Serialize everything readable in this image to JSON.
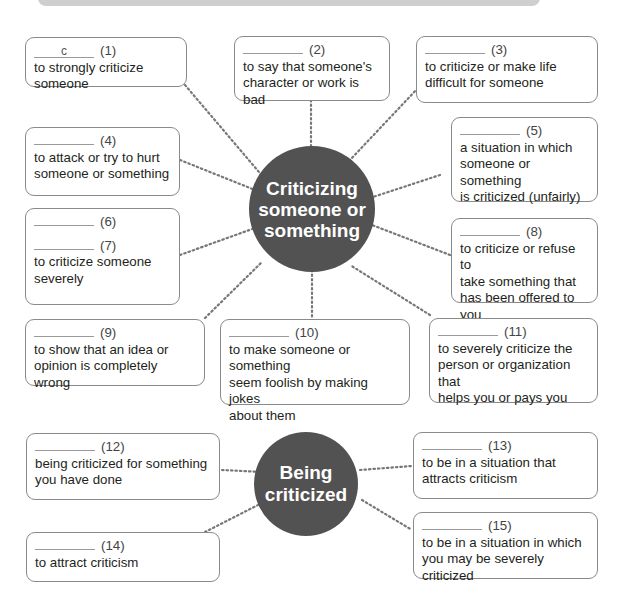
{
  "diagram": {
    "hub1": {
      "label_lines": [
        "Criticizing",
        "someone or",
        "something"
      ]
    },
    "hub2": {
      "label_lines": [
        "Being",
        "criticized"
      ]
    },
    "boxes": [
      {
        "num": "(1)",
        "answer": "c",
        "def": [
          "to strongly criticize someone"
        ]
      },
      {
        "num": "(2)",
        "answer": "",
        "def": [
          "to say that someone's",
          "character or work is bad"
        ]
      },
      {
        "num": "(3)",
        "answer": "",
        "def": [
          "to criticize or make life",
          "difficult for someone"
        ]
      },
      {
        "num": "(4)",
        "answer": "",
        "def": [
          "to attack or try to hurt",
          "someone or something"
        ]
      },
      {
        "num": "(5)",
        "answer": "",
        "def": [
          "a situation in which",
          "someone or something",
          "is criticized (unfairly)"
        ]
      },
      {
        "num": "(6)",
        "answer": "",
        "def": []
      },
      {
        "num": "(7)",
        "answer": "",
        "def": [
          "to criticize someone",
          "severely"
        ]
      },
      {
        "num": "(8)",
        "answer": "",
        "def": [
          "to criticize or refuse to",
          "take something that",
          "has been offered to you"
        ]
      },
      {
        "num": "(9)",
        "answer": "",
        "def": [
          "to show that an idea or",
          "opinion is completely wrong"
        ]
      },
      {
        "num": "(10)",
        "answer": "",
        "def": [
          "to make someone or something",
          "seem foolish by making jokes",
          "about them"
        ]
      },
      {
        "num": "(11)",
        "answer": "",
        "def": [
          "to severely criticize the",
          "person or organization that",
          "helps you or pays you"
        ]
      },
      {
        "num": "(12)",
        "answer": "",
        "def": [
          "being criticized for something",
          "you have done"
        ]
      },
      {
        "num": "(13)",
        "answer": "",
        "def": [
          "to be in a situation that",
          "attracts criticism"
        ]
      },
      {
        "num": "(14)",
        "answer": "",
        "def": [
          "to attract criticism"
        ]
      },
      {
        "num": "(15)",
        "answer": "",
        "def": [
          "to be in a situation in which",
          "you may be severely criticized"
        ]
      }
    ]
  }
}
